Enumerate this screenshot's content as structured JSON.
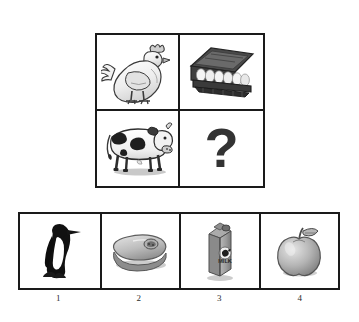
{
  "puzzle": {
    "type": "visual-analogy-matrix",
    "matrix": {
      "rows": 2,
      "columns": 2,
      "cells": [
        {
          "position": "top-left",
          "icon": "chicken-icon",
          "label": "chicken"
        },
        {
          "position": "top-right",
          "icon": "egg-carton-icon",
          "label": "egg carton"
        },
        {
          "position": "bottom-left",
          "icon": "cow-icon",
          "label": "cow"
        },
        {
          "position": "bottom-right",
          "icon": "question-mark-icon",
          "label": "?"
        }
      ]
    },
    "answers": {
      "options": [
        {
          "number": "1",
          "icon": "penguin-icon",
          "label": "penguin"
        },
        {
          "number": "2",
          "icon": "steak-icon",
          "label": "steak"
        },
        {
          "number": "3",
          "icon": "milk-carton-icon",
          "label": "milk carton"
        },
        {
          "number": "4",
          "icon": "apple-icon",
          "label": "apple"
        }
      ]
    },
    "milk_carton_text": "MILK"
  },
  "colors": {
    "border": "#1a1a1a",
    "background": "#ffffff",
    "question_mark": "#333333",
    "ink_dark": "#2b2b2b",
    "gray_mid": "#9a9a9a",
    "gray_light": "#cfcfcf"
  }
}
